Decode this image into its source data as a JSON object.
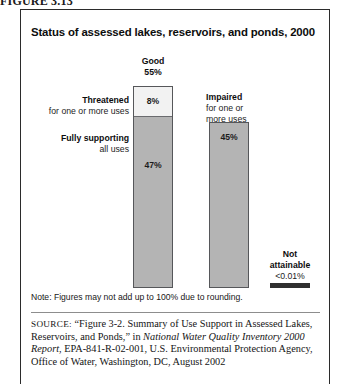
{
  "figure": {
    "label": "FIGURE 3.13"
  },
  "chart": {
    "title": "Status of assessed lakes, reservoirs, and ponds, 2000",
    "note": "Note: Figures may not add up to 100% due to rounding.",
    "callouts": {
      "good_head": "Good",
      "good_value": "55%",
      "threatened_head": "Threatened",
      "threatened_sub": "for one or more uses",
      "fully_head": "Fully supporting",
      "fully_sub": "all uses",
      "impaired_head": "Impaired",
      "impaired_sub_line1": "for one or",
      "impaired_sub_line2": "more uses",
      "notattainable_head": "Not",
      "notattainable_head2": "attainable",
      "notattainable_value": "<0.01%"
    },
    "bar_labels": {
      "threatened_pct": "8%",
      "fully_pct": "47%",
      "impaired_pct": "45%"
    },
    "colors": {
      "bar_fill": "#b4b4b4",
      "bar_fill_light": "#f2f2f2",
      "bar_stroke": "#56575a",
      "notattainable_fill": "#2f2f2f",
      "frame": "#2b2b2b"
    }
  },
  "chart_data": {
    "type": "bar",
    "title": "Status of assessed lakes, reservoirs, and ponds, 2000",
    "xlabel": "",
    "ylabel": "Percent of assessed lake acres",
    "ylim": [
      0,
      55
    ],
    "grid": false,
    "legend": "none",
    "stacked": true,
    "categories": [
      "Good",
      "Impaired",
      "Not attainable"
    ],
    "series": [
      {
        "name": "Fully supporting all uses",
        "values": [
          47,
          null,
          null
        ]
      },
      {
        "name": "Threatened for one or more uses",
        "values": [
          8,
          null,
          null
        ]
      },
      {
        "name": "Impaired for one or more uses",
        "values": [
          null,
          45,
          null
        ]
      },
      {
        "name": "Not attainable",
        "values": [
          null,
          null,
          0.01
        ]
      }
    ],
    "bar_totals": [
      55,
      45,
      0.01
    ],
    "data_labels": [
      "8%",
      "47%",
      "45%",
      "<0.01%"
    ],
    "annotations": [
      "Good 55%",
      "Threatened for one or more uses 8%",
      "Fully supporting all uses 47%",
      "Impaired for one or more uses 45%",
      "Not attainable <0.01%"
    ],
    "note": "Note: Figures may not add up to 100% due to rounding."
  },
  "source": {
    "kicker": "SOURCE:",
    "text_part1": "“Figure 3-2. Summary of Use Support in Assessed Lakes, Reservoirs, and Ponds,” in ",
    "italic1": "National Water Quality Inventory 2000 Report",
    "text_part2": ", EPA-841-R-02-001, U.S. Environmental Protection Agency, Office of Water, Washington, DC, August 2002"
  }
}
